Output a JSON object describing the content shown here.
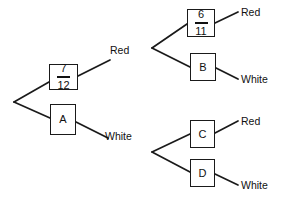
{
  "diagram": {
    "type": "probability-tree",
    "root": {
      "x": 14,
      "y": 102
    },
    "level1": {
      "branch_a": {
        "box_name": "seven-twelfths",
        "numerator": "7",
        "denominator": "12",
        "box": {
          "x": 49,
          "y": 64,
          "w": 29,
          "h": 26
        },
        "outgoing_label": "Red"
      },
      "branch_b": {
        "box_name": "box-a",
        "label": "A",
        "box": {
          "x": 50,
          "y": 104,
          "w": 26,
          "h": 31
        },
        "outgoing_label": "White"
      }
    },
    "edge_labels": {
      "red": "Red",
      "white": "White"
    },
    "level2_top": {
      "vertex": {
        "x": 152,
        "y": 48
      },
      "upper": {
        "box_name": "six-elevenths",
        "numerator": "6",
        "denominator": "11",
        "box": {
          "x": 187,
          "y": 9,
          "w": 28,
          "h": 28
        },
        "outcome": "Red"
      },
      "lower": {
        "box_name": "box-b",
        "label": "B",
        "box": {
          "x": 190,
          "y": 53,
          "w": 26,
          "h": 28
        },
        "outcome": "White"
      }
    },
    "level2_bottom": {
      "vertex": {
        "x": 152,
        "y": 152
      },
      "upper": {
        "box_name": "box-c",
        "label": "C",
        "box": {
          "x": 190,
          "y": 120,
          "w": 25,
          "h": 28
        },
        "outcome": "Red"
      },
      "lower": {
        "box_name": "box-d",
        "label": "D",
        "box": {
          "x": 190,
          "y": 159,
          "w": 25,
          "h": 28
        },
        "outcome": "White"
      }
    },
    "outcome_labels": {
      "top_red": "Red",
      "top_white": "White",
      "bottom_red": "Red",
      "bottom_white": "White"
    },
    "colors": {
      "line": "#1a1a1a",
      "text": "#111111",
      "background": "#ffffff"
    }
  }
}
